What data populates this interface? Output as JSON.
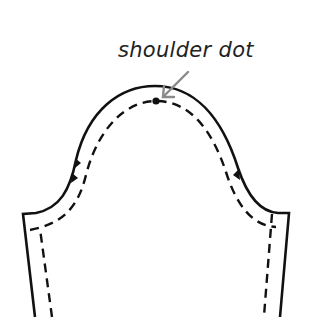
{
  "diagram": {
    "annotation": {
      "label": "shoulder dot",
      "arrow_color": "#8a8a8a"
    },
    "colors": {
      "outline": "#111111",
      "seam_line": "#111111",
      "background": "#ffffff"
    },
    "notches": {
      "left_count": 2,
      "right_count": 1
    }
  }
}
